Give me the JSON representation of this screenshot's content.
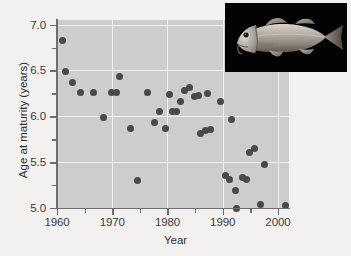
{
  "figure": {
    "background_color": "#f2f1ef",
    "panel_color": "#cdcdcb",
    "grid_color": "#f0f0ee",
    "axis_color": "#6d6d6d",
    "marker_color": "#494949"
  },
  "axis_titles": {
    "x": "Year",
    "y": "Age at maturity (years)"
  },
  "inset": {
    "name": "cod-photograph",
    "alt": "Atlantic cod fish photograph",
    "background_color": "#030303"
  },
  "chart_data": {
    "type": "scatter",
    "title": "",
    "xlabel": "Year",
    "ylabel": "Age at maturity (years)",
    "xlim": [
      1960,
      2002
    ],
    "ylim": [
      5.0,
      7.05
    ],
    "grid": true,
    "legend": null,
    "xticks": [
      1960,
      1970,
      1980,
      1990,
      2000
    ],
    "xtick_labels": [
      "1960",
      "1970",
      "1980",
      "1990",
      "2000"
    ],
    "xminorticks": [
      1965,
      1975,
      1985,
      1995
    ],
    "yticks": [
      5.0,
      5.5,
      6.0,
      6.5,
      7.0
    ],
    "ytick_labels": [
      "5.0",
      "5.5",
      "6.0",
      "6.5",
      "7.0"
    ],
    "yminorticks": [
      5.25,
      5.75,
      6.25,
      6.75
    ],
    "points": [
      {
        "x": 1961.0,
        "y": 6.83
      },
      {
        "x": 1961.5,
        "y": 6.49
      },
      {
        "x": 1962.8,
        "y": 6.37
      },
      {
        "x": 1964.2,
        "y": 6.26
      },
      {
        "x": 1966.6,
        "y": 6.26
      },
      {
        "x": 1968.5,
        "y": 5.99
      },
      {
        "x": 1969.8,
        "y": 6.26
      },
      {
        "x": 1970.7,
        "y": 6.26
      },
      {
        "x": 1971.4,
        "y": 6.43
      },
      {
        "x": 1973.3,
        "y": 5.87
      },
      {
        "x": 1974.5,
        "y": 5.3
      },
      {
        "x": 1976.4,
        "y": 6.26
      },
      {
        "x": 1977.6,
        "y": 5.93
      },
      {
        "x": 1978.6,
        "y": 6.05
      },
      {
        "x": 1979.6,
        "y": 5.87
      },
      {
        "x": 1980.3,
        "y": 6.24
      },
      {
        "x": 1980.9,
        "y": 6.05
      },
      {
        "x": 1981.6,
        "y": 6.05
      },
      {
        "x": 1982.3,
        "y": 6.16
      },
      {
        "x": 1983.0,
        "y": 6.28
      },
      {
        "x": 1984.0,
        "y": 6.31
      },
      {
        "x": 1984.9,
        "y": 6.22
      },
      {
        "x": 1985.6,
        "y": 6.23
      },
      {
        "x": 1985.9,
        "y": 5.81
      },
      {
        "x": 1986.8,
        "y": 5.85
      },
      {
        "x": 1987.3,
        "y": 6.25
      },
      {
        "x": 1987.8,
        "y": 5.86
      },
      {
        "x": 1989.6,
        "y": 6.16
      },
      {
        "x": 1990.5,
        "y": 5.35
      },
      {
        "x": 1991.3,
        "y": 5.31
      },
      {
        "x": 1991.6,
        "y": 5.96
      },
      {
        "x": 1992.3,
        "y": 5.19
      },
      {
        "x": 1992.5,
        "y": 5.0
      },
      {
        "x": 1993.5,
        "y": 5.33
      },
      {
        "x": 1994.3,
        "y": 5.31
      },
      {
        "x": 1994.9,
        "y": 5.61
      },
      {
        "x": 1995.7,
        "y": 5.65
      },
      {
        "x": 1996.8,
        "y": 5.04
      },
      {
        "x": 1997.5,
        "y": 5.47
      },
      {
        "x": 2001.3,
        "y": 5.03
      }
    ]
  }
}
